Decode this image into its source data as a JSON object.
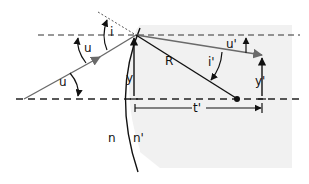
{
  "diagram": {
    "colors": {
      "background": "#ffffff",
      "shade": "#f1f1f1",
      "line": "#111111",
      "ray": "#6a6a6a",
      "dashed": "#333333"
    },
    "labels": {
      "u": "u",
      "u_lower": "u",
      "i": "i",
      "u_prime": "u'",
      "i_prime": "i'",
      "R": "R",
      "y": "y",
      "y_prime": "y'",
      "t_prime": "t'",
      "n": "n",
      "n_prime": "n'"
    }
  }
}
